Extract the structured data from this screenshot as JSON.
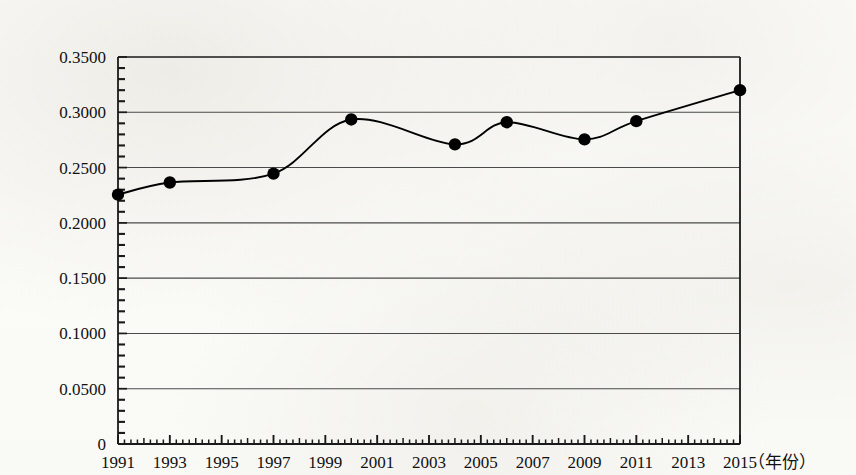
{
  "chart_data": {
    "type": "line",
    "title": "",
    "xlabel": "（年份）",
    "ylabel": "",
    "x": [
      1991,
      1993,
      1997,
      2000,
      2004,
      2006,
      2009,
      2011,
      2015
    ],
    "values": [
      0.2255,
      0.2365,
      0.2445,
      0.2935,
      0.271,
      0.291,
      0.2755,
      0.292,
      0.32
    ],
    "series": [
      {
        "name": "",
        "points": [
          {
            "x": 1991,
            "y": 0.2255
          },
          {
            "x": 1993,
            "y": 0.2365
          },
          {
            "x": 1997,
            "y": 0.2445
          },
          {
            "x": 2000,
            "y": 0.2935
          },
          {
            "x": 2004,
            "y": 0.271
          },
          {
            "x": 2006,
            "y": 0.291
          },
          {
            "x": 2009,
            "y": 0.2755
          },
          {
            "x": 2011,
            "y": 0.292
          },
          {
            "x": 2015,
            "y": 0.32
          }
        ]
      }
    ],
    "xlim": [
      1991,
      2015
    ],
    "ylim": [
      0,
      0.35
    ],
    "y_ticks": [
      0,
      0.05,
      0.1,
      0.15,
      0.2,
      0.25,
      0.3,
      0.35
    ],
    "y_tick_labels": [
      "0",
      "0.0500",
      "0.1000",
      "0.1500",
      "0.2000",
      "0.2500",
      "0.3000",
      "0.3500"
    ],
    "x_ticks": [
      1991,
      1993,
      1995,
      1997,
      1999,
      2001,
      2003,
      2005,
      2007,
      2009,
      2011,
      2013,
      2015
    ],
    "x_tick_labels": [
      "1991",
      "1993",
      "1995",
      "1997",
      "1999",
      "2001",
      "2003",
      "2005",
      "2007",
      "2009",
      "2011",
      "2013",
      "2015"
    ],
    "grid": "horizontal",
    "legend": "none",
    "minor_ticks_per_major_y": 5,
    "marker": "filled-circle",
    "marker_color": "#000000",
    "line_color": "#000000",
    "axis_color": "#000000",
    "grid_color": "#4a4a4a",
    "smoothing": "spline"
  },
  "axis": {
    "x_unit_label": "（年份）"
  }
}
